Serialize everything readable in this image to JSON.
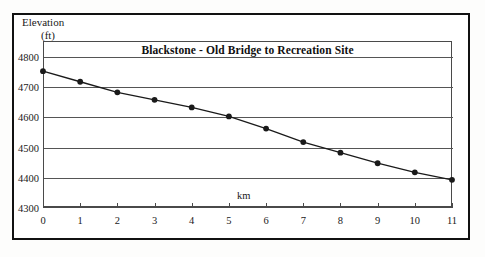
{
  "chart_data": {
    "type": "line",
    "title": "Blackstone - Old Bridge to Recreation Site",
    "xlabel": "km",
    "ylabel": "Elevation",
    "ylabel_unit": "(ft)",
    "x": [
      0,
      1,
      2,
      3,
      4,
      5,
      6,
      7,
      8,
      9,
      10,
      11
    ],
    "values": [
      4750,
      4715,
      4680,
      4655,
      4630,
      4600,
      4560,
      4515,
      4480,
      4445,
      4415,
      4390
    ],
    "xticks": [
      "0",
      "1",
      "2",
      "3",
      "4",
      "5",
      "6",
      "7",
      "8",
      "9",
      "10",
      "11"
    ],
    "yticks": [
      "4300",
      "4400",
      "4500",
      "4600",
      "4700",
      "4800"
    ],
    "xlim": [
      0,
      11
    ],
    "ylim": [
      4300,
      4850
    ],
    "grid": "horizontal",
    "legend": "none",
    "marker": "filled-circle",
    "line_color": "#1a1a1a",
    "grid_color": "#555555",
    "frame_color": "#111111"
  }
}
